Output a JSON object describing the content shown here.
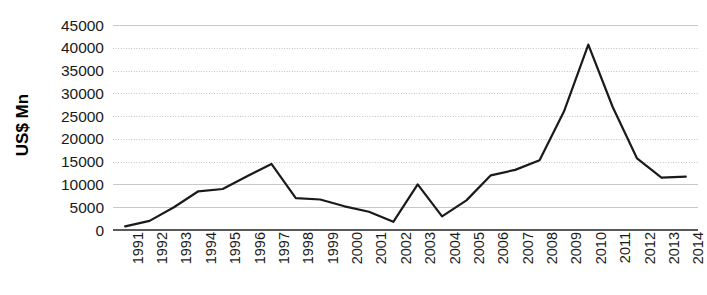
{
  "chart_data": {
    "type": "line",
    "title": "",
    "subtitle": "",
    "xlabel": "",
    "ylabel": "US$ Mn",
    "categories": [
      "1991",
      "1992",
      "1993",
      "1994",
      "1995",
      "1996",
      "1997",
      "1998",
      "1999",
      "2000",
      "2001",
      "2002",
      "2003",
      "2004",
      "2005",
      "2006",
      "2007",
      "2008",
      "2009",
      "2010",
      "2011",
      "2012",
      "2013",
      "2014"
    ],
    "values": [
      800,
      2000,
      5000,
      8500,
      9000,
      11800,
      14500,
      7000,
      6700,
      5200,
      4000,
      1800,
      10000,
      3000,
      6500,
      12000,
      13200,
      15300,
      26000,
      40700,
      27000,
      15700,
      11500,
      11700
    ],
    "series": [
      {
        "name": "US$ Mn",
        "values": [
          800,
          2000,
          5000,
          8500,
          9000,
          11800,
          14500,
          7000,
          6700,
          5200,
          4000,
          1800,
          10000,
          3000,
          6500,
          12000,
          13200,
          15300,
          26000,
          40700,
          27000,
          15700,
          11500,
          11700
        ]
      }
    ],
    "ylim": [
      0,
      45000
    ],
    "yticks": [
      0,
      5000,
      10000,
      15000,
      20000,
      25000,
      30000,
      35000,
      40000,
      45000
    ],
    "ytick_labels": [
      "0",
      "5000",
      "10000",
      "15000",
      "20000",
      "25000",
      "30000",
      "35000",
      "40000",
      "45000"
    ],
    "grid": true,
    "grid_styles": [
      "solid",
      "solid",
      "solid",
      "dotted",
      "dotted",
      "dotted",
      "dotted",
      "dotted",
      "dotted",
      "solid"
    ],
    "legend": false,
    "legend_position": "none",
    "line_color": "#1a1a1a",
    "line_width": 2.2,
    "background_color": "#ffffff",
    "grid_color": "#c8c8c8",
    "axis_color": "#595959",
    "markers": false,
    "annotations": []
  }
}
